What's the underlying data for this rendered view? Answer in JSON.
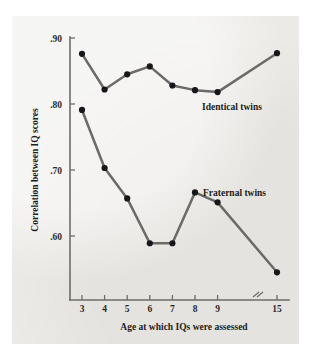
{
  "chart_data": {
    "type": "line",
    "title": "",
    "xlabel": "Age at which IQs were assessed",
    "ylabel": "Correlation between IQ scores",
    "x": [
      3,
      4,
      5,
      6,
      7,
      8,
      9,
      15
    ],
    "categories": [
      "3",
      "4",
      "5",
      "6",
      "7",
      "8",
      "9",
      "15"
    ],
    "xtick_labels": [
      "3",
      "4",
      "5",
      "6",
      "7",
      "8",
      "9",
      "15"
    ],
    "ytick_labels": [
      ".90",
      ".80",
      ".70",
      ".60"
    ],
    "ytick_values": [
      0.9,
      0.8,
      0.7,
      0.6
    ],
    "ylim": [
      0.53,
      0.9
    ],
    "xlim": [
      3,
      15
    ],
    "x_axis_break": true,
    "x_axis_break_after": 9,
    "grid": false,
    "legend": "inline-annotations",
    "legend_position": "right-inline",
    "series": [
      {
        "name": "Identical twins",
        "label": "Identical twins",
        "color": "#6b6a67",
        "marker_color": "#17161a",
        "values": [
          0.876,
          0.822,
          0.845,
          0.857,
          0.828,
          0.821,
          0.818,
          0.877
        ]
      },
      {
        "name": "Fraternal twins",
        "label": "Fraternal twins",
        "color": "#6b6a67",
        "marker_color": "#17161a",
        "values": [
          0.791,
          0.703,
          0.657,
          0.589,
          0.589,
          0.666,
          0.651,
          0.545
        ]
      }
    ],
    "annotations": [
      {
        "text": "Identical twins",
        "for_series": "Identical twins"
      },
      {
        "text": "Fraternal twins",
        "for_series": "Fraternal twins"
      }
    ]
  },
  "axes": {
    "y_title": "Correlation between IQ scores",
    "x_title": "Age at which IQs were assessed"
  },
  "colors": {
    "paper": "#eceae6",
    "line": "#6b6a67",
    "marker": "#17161a",
    "axis": "#6e6c68",
    "text": "#1d1c1a"
  }
}
